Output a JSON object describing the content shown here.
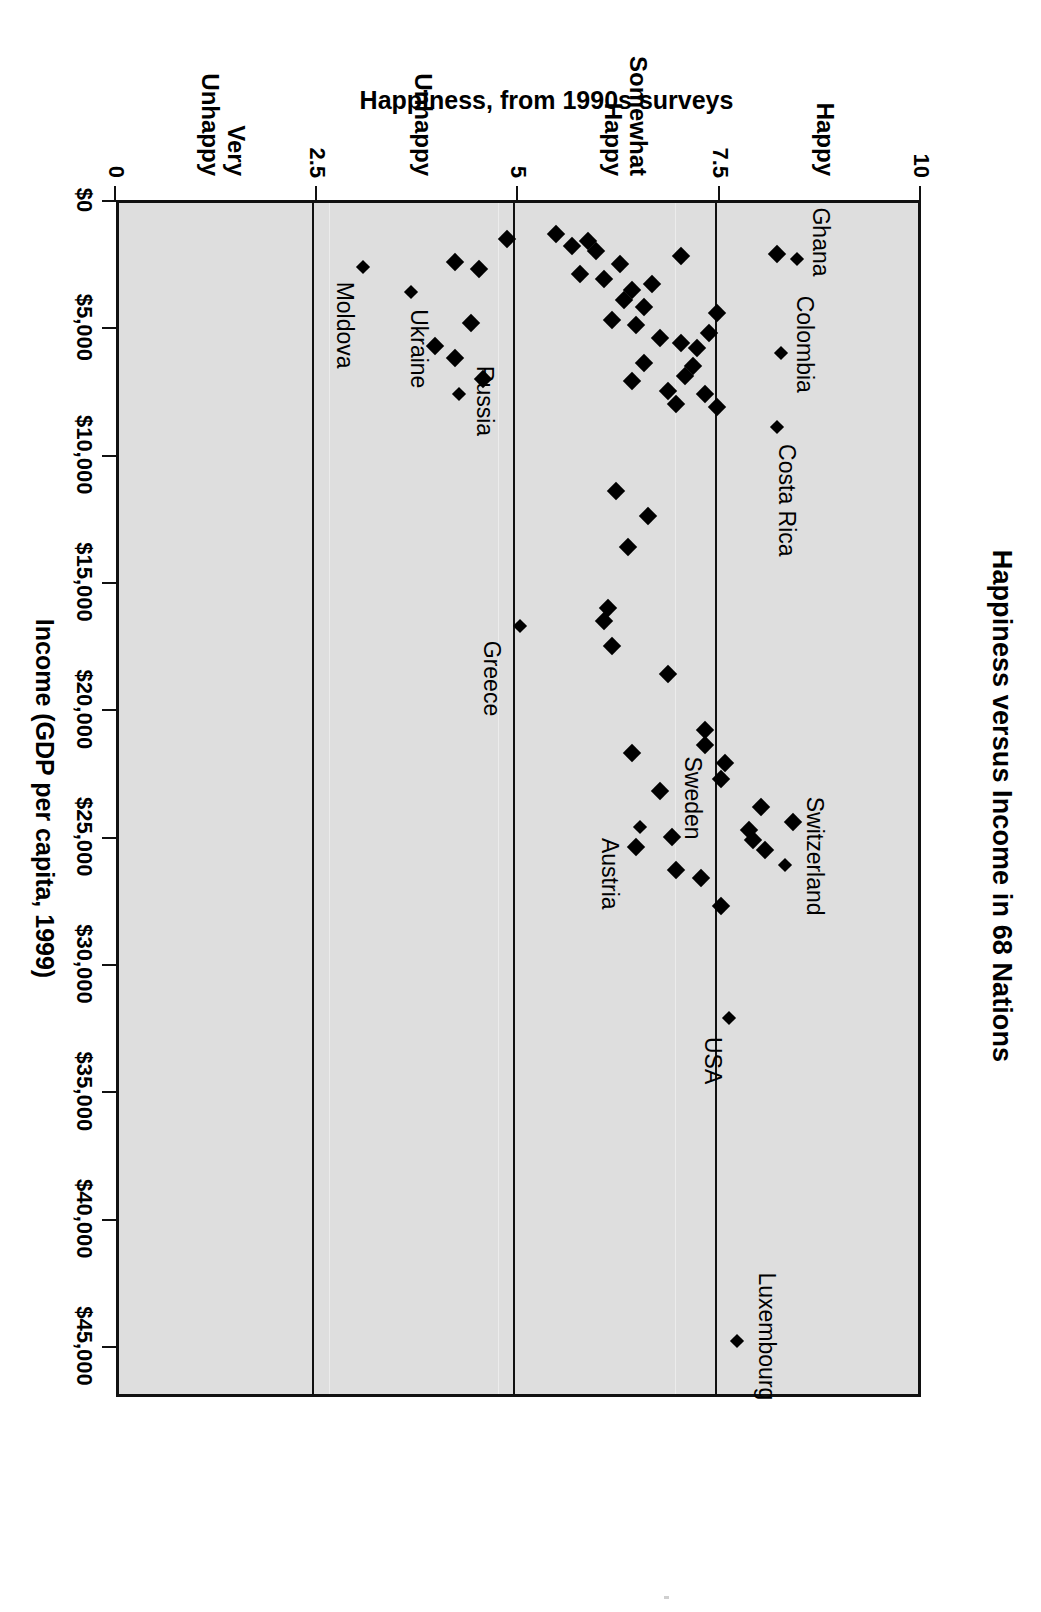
{
  "title": "Happiness versus Income in 68 Nations",
  "axis": {
    "x_title": "Income (GDP per capita, 1999)",
    "y_title": "Happiness, from 1990s surveys"
  },
  "chart_data": {
    "type": "scatter",
    "title": "Happiness versus Income in 68 Nations",
    "xlabel": "Income (GDP per capita, 1999)",
    "ylabel": "Happiness, from 1990s surveys",
    "xlim": [
      0,
      47000
    ],
    "ylim": [
      0,
      10
    ],
    "grid": "horizontal gridlines at happiness 7.5, 5.0, 2.5",
    "legend": "none",
    "marker": "black filled diamond",
    "plot_background": "#dedede",
    "orientation_note": "source image is this landscape chart rotated 90 degrees clockwise",
    "xticks": [
      {
        "value": 0,
        "label": "$0"
      },
      {
        "value": 5000,
        "label": "$5,000"
      },
      {
        "value": 10000,
        "label": "$10,000"
      },
      {
        "value": 15000,
        "label": "$15,000"
      },
      {
        "value": 20000,
        "label": "$20,000"
      },
      {
        "value": 25000,
        "label": "$25,000"
      },
      {
        "value": 30000,
        "label": "$30,000"
      },
      {
        "value": 35000,
        "label": "$35,000"
      },
      {
        "value": 40000,
        "label": "$40,000"
      },
      {
        "value": 45000,
        "label": "$45,000"
      }
    ],
    "yticks": [
      {
        "value": 10,
        "label": "10"
      },
      {
        "value": 7.5,
        "label": "7.5"
      },
      {
        "value": 5,
        "label": "5"
      },
      {
        "value": 2.5,
        "label": "2.5"
      },
      {
        "value": 0,
        "label": "0"
      }
    ],
    "y_categories": [
      {
        "label": "Happy",
        "value": 8.8
      },
      {
        "label": "Somewhat\nHappy",
        "value": 6.3
      },
      {
        "label": "Unhappy",
        "value": 3.8
      },
      {
        "label": "Very\nUnhappy",
        "value": 1.3
      }
    ],
    "labeled_points": [
      {
        "name": "Luxembourg",
        "x": 44700,
        "y": 7.75
      },
      {
        "name": "USA",
        "x": 32000,
        "y": 7.65
      },
      {
        "name": "Switzerland",
        "x": 26000,
        "y": 8.35
      },
      {
        "name": "Sweden",
        "x": 22400,
        "y": 7.75
      },
      {
        "name": "Austria",
        "x": 24500,
        "y": 6.55
      },
      {
        "name": "Greece",
        "x": 16600,
        "y": 5.05
      },
      {
        "name": "Costa Rica",
        "x": 8800,
        "y": 8.25
      },
      {
        "name": "Colombia",
        "x": 5900,
        "y": 8.3
      },
      {
        "name": "Ghana",
        "x": 2200,
        "y": 8.5
      },
      {
        "name": "Russia",
        "x": 7500,
        "y": 4.3
      },
      {
        "name": "Ukraine",
        "x": 3500,
        "y": 3.7
      },
      {
        "name": "Moldova",
        "x": 2500,
        "y": 3.1
      }
    ],
    "points": [
      {
        "x": 44700,
        "y": 7.75
      },
      {
        "x": 32000,
        "y": 7.65
      },
      {
        "x": 27600,
        "y": 7.55
      },
      {
        "x": 26000,
        "y": 8.35
      },
      {
        "x": 25400,
        "y": 8.1
      },
      {
        "x": 24300,
        "y": 8.45
      },
      {
        "x": 25000,
        "y": 7.95
      },
      {
        "x": 23700,
        "y": 8.05
      },
      {
        "x": 24600,
        "y": 7.9
      },
      {
        "x": 26500,
        "y": 7.3
      },
      {
        "x": 26200,
        "y": 7.0
      },
      {
        "x": 24900,
        "y": 6.95
      },
      {
        "x": 24500,
        "y": 6.55
      },
      {
        "x": 25300,
        "y": 6.5
      },
      {
        "x": 23100,
        "y": 6.8
      },
      {
        "x": 22600,
        "y": 7.55
      },
      {
        "x": 22000,
        "y": 7.6
      },
      {
        "x": 21300,
        "y": 7.35
      },
      {
        "x": 20700,
        "y": 7.35
      },
      {
        "x": 21600,
        "y": 6.45
      },
      {
        "x": 18500,
        "y": 6.9
      },
      {
        "x": 16600,
        "y": 5.05
      },
      {
        "x": 17400,
        "y": 6.2
      },
      {
        "x": 16400,
        "y": 6.1
      },
      {
        "x": 15900,
        "y": 6.15
      },
      {
        "x": 13500,
        "y": 6.4
      },
      {
        "x": 12300,
        "y": 6.65
      },
      {
        "x": 11300,
        "y": 6.25
      },
      {
        "x": 8800,
        "y": 8.25
      },
      {
        "x": 8000,
        "y": 7.5
      },
      {
        "x": 7900,
        "y": 7.0
      },
      {
        "x": 7500,
        "y": 7.35
      },
      {
        "x": 7400,
        "y": 6.9
      },
      {
        "x": 7000,
        "y": 6.45
      },
      {
        "x": 6800,
        "y": 7.1
      },
      {
        "x": 6400,
        "y": 7.2
      },
      {
        "x": 6300,
        "y": 6.6
      },
      {
        "x": 5900,
        "y": 8.3
      },
      {
        "x": 5700,
        "y": 7.25
      },
      {
        "x": 5500,
        "y": 7.05
      },
      {
        "x": 5300,
        "y": 6.8
      },
      {
        "x": 5100,
        "y": 7.4
      },
      {
        "x": 4800,
        "y": 6.5
      },
      {
        "x": 4600,
        "y": 6.2
      },
      {
        "x": 4300,
        "y": 7.5
      },
      {
        "x": 4100,
        "y": 6.6
      },
      {
        "x": 3800,
        "y": 6.35
      },
      {
        "x": 3500,
        "y": 3.7
      },
      {
        "x": 3400,
        "y": 6.45
      },
      {
        "x": 3200,
        "y": 6.7
      },
      {
        "x": 3000,
        "y": 6.1
      },
      {
        "x": 2800,
        "y": 5.8
      },
      {
        "x": 2500,
        "y": 3.1
      },
      {
        "x": 2400,
        "y": 6.3
      },
      {
        "x": 2200,
        "y": 8.5
      },
      {
        "x": 2000,
        "y": 8.25
      },
      {
        "x": 2100,
        "y": 7.05
      },
      {
        "x": 1900,
        "y": 6.0
      },
      {
        "x": 1700,
        "y": 5.7
      },
      {
        "x": 1500,
        "y": 5.9
      },
      {
        "x": 1400,
        "y": 4.9
      },
      {
        "x": 1200,
        "y": 5.5
      },
      {
        "x": 7500,
        "y": 4.3
      },
      {
        "x": 6900,
        "y": 4.6
      },
      {
        "x": 6100,
        "y": 4.25
      },
      {
        "x": 5600,
        "y": 4.0
      },
      {
        "x": 4700,
        "y": 4.45
      },
      {
        "x": 2600,
        "y": 4.55
      },
      {
        "x": 2300,
        "y": 4.25
      }
    ]
  }
}
